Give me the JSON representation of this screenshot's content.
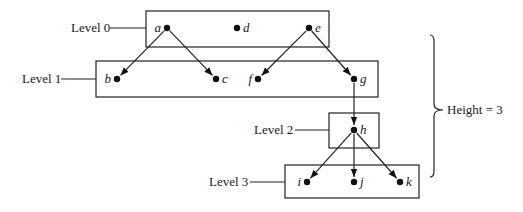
{
  "diagram": {
    "title": "",
    "levels": [
      {
        "id": "level-0",
        "label": "Level 0",
        "box": {
          "x": 146,
          "y": 11,
          "w": 183,
          "h": 36
        },
        "label_pos": {
          "x": 71,
          "y": 32
        },
        "leader": {
          "x1": 110,
          "x2": 146,
          "y": 28
        }
      },
      {
        "id": "level-1",
        "label": "Level 1",
        "box": {
          "x": 96,
          "y": 61,
          "w": 282,
          "h": 36
        },
        "label_pos": {
          "x": 22,
          "y": 83
        },
        "leader": {
          "x1": 61,
          "x2": 96,
          "y": 79
        }
      },
      {
        "id": "level-2",
        "label": "Level 2",
        "box": {
          "x": 329,
          "y": 113,
          "w": 50,
          "h": 35
        },
        "label_pos": {
          "x": 254,
          "y": 134
        },
        "leader": {
          "x1": 295,
          "x2": 329,
          "y": 130
        }
      },
      {
        "id": "level-3",
        "label": "Level 3",
        "box": {
          "x": 285,
          "y": 165,
          "w": 134,
          "h": 33
        },
        "label_pos": {
          "x": 209,
          "y": 186
        },
        "leader": {
          "x1": 250,
          "x2": 285,
          "y": 182
        }
      }
    ],
    "nodes": [
      {
        "id": "a",
        "label": "a",
        "x": 167,
        "y": 28,
        "label_side": "left"
      },
      {
        "id": "d",
        "label": "d",
        "x": 237,
        "y": 28,
        "label_side": "right"
      },
      {
        "id": "e",
        "label": "e",
        "x": 309,
        "y": 28,
        "label_side": "right"
      },
      {
        "id": "b",
        "label": "b",
        "x": 117,
        "y": 79,
        "label_side": "left"
      },
      {
        "id": "c",
        "label": "c",
        "x": 216,
        "y": 79,
        "label_side": "right"
      },
      {
        "id": "f",
        "label": "f",
        "x": 258,
        "y": 79,
        "label_side": "left"
      },
      {
        "id": "g",
        "label": "g",
        "x": 354,
        "y": 79,
        "label_side": "right"
      },
      {
        "id": "h",
        "label": "h",
        "x": 354,
        "y": 130,
        "label_side": "right"
      },
      {
        "id": "i",
        "label": "i",
        "x": 307,
        "y": 182,
        "label_side": "left"
      },
      {
        "id": "j",
        "label": "j",
        "x": 354,
        "y": 182,
        "label_side": "right"
      },
      {
        "id": "k",
        "label": "k",
        "x": 400,
        "y": 182,
        "label_side": "right"
      }
    ],
    "edges": [
      {
        "from": "a",
        "to": "b"
      },
      {
        "from": "a",
        "to": "c"
      },
      {
        "from": "e",
        "to": "f"
      },
      {
        "from": "e",
        "to": "g"
      },
      {
        "from": "g",
        "to": "h"
      },
      {
        "from": "h",
        "to": "i"
      },
      {
        "from": "h",
        "to": "j"
      },
      {
        "from": "h",
        "to": "k"
      }
    ],
    "brace": {
      "x": 434,
      "top": 35,
      "bottom": 177,
      "tip_x": 443,
      "tip_y": 110
    },
    "height_label": "Height = 3",
    "height_label_pos": {
      "x": 447,
      "y": 114
    },
    "colors": {
      "stroke": "#222222",
      "text": "#1a1a1a",
      "background": "#ffffff"
    }
  }
}
